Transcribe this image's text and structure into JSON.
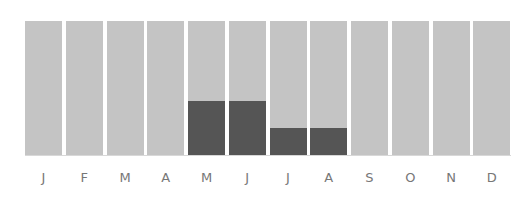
{
  "chart_data": {
    "type": "bar",
    "title": "",
    "xlabel": "",
    "ylabel": "",
    "ylim": [
      0,
      100
    ],
    "categories": [
      "J",
      "F",
      "M",
      "A",
      "M",
      "J",
      "J",
      "A",
      "S",
      "O",
      "N",
      "D"
    ],
    "series": [
      {
        "name": "background",
        "values": [
          100,
          100,
          100,
          100,
          100,
          100,
          100,
          100,
          100,
          100,
          100,
          100
        ],
        "color": "#c4c4c4"
      },
      {
        "name": "value",
        "values": [
          0,
          0,
          0,
          0,
          40,
          40,
          20,
          20,
          0,
          0,
          0,
          0
        ],
        "color": "#555555"
      }
    ],
    "grid": false,
    "legend": "none"
  },
  "labels": [
    "J",
    "F",
    "M",
    "A",
    "M",
    "J",
    "J",
    "A",
    "S",
    "O",
    "N",
    "D"
  ]
}
